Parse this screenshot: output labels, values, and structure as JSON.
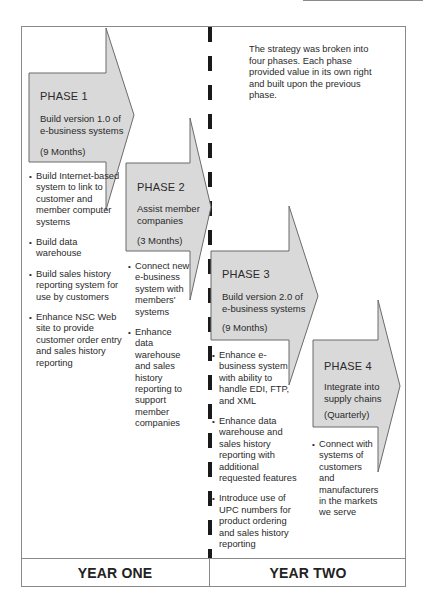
{
  "intro_text": "The strategy was broken into four phases. Each phase provided value in its own right and built upon the previous phase.",
  "colors": {
    "arrow_fill": "#d9d9d9",
    "arrow_stroke": "#6b6b6b",
    "divider": "#1a1a1a",
    "frame": "#8a8a8a"
  },
  "phases": [
    {
      "title": "PHASE 1",
      "subtitle_lines": [
        "Build version 1.0 of",
        "e-business systems"
      ],
      "duration": "(9 Months)",
      "bullets": [
        "Build Internet-based system to link to customer and member computer systems",
        "Build data warehouse",
        "Build sales history reporting system for use by customers",
        "Enhance NSC Web site to provide customer order entry and sales history reporting"
      ]
    },
    {
      "title": "PHASE 2",
      "subtitle_lines": [
        "Assist member",
        "companies"
      ],
      "duration": "(3 Months)",
      "bullets": [
        "Connect new e-business system with members' systems",
        "Enhance data warehouse and sales history reporting to support member companies"
      ]
    },
    {
      "title": "PHASE 3",
      "subtitle_lines": [
        "Build version 2.0 of",
        "e-business systems"
      ],
      "duration": "(9 Months)",
      "bullets": [
        "Enhance e-business system with ability to handle EDI, FTP, and XML",
        "Enhance data warehouse and sales history reporting with additional requested features",
        "Introduce use of UPC numbers for product ordering and sales history reporting"
      ]
    },
    {
      "title": "PHASE 4",
      "subtitle_lines": [
        "Integrate into",
        "supply chains"
      ],
      "duration": "(Quarterly)",
      "bullets": [
        "Connect with systems of customers and manufacturers in the markets we serve"
      ]
    }
  ],
  "years": {
    "one": "YEAR ONE",
    "two": "YEAR TWO"
  }
}
